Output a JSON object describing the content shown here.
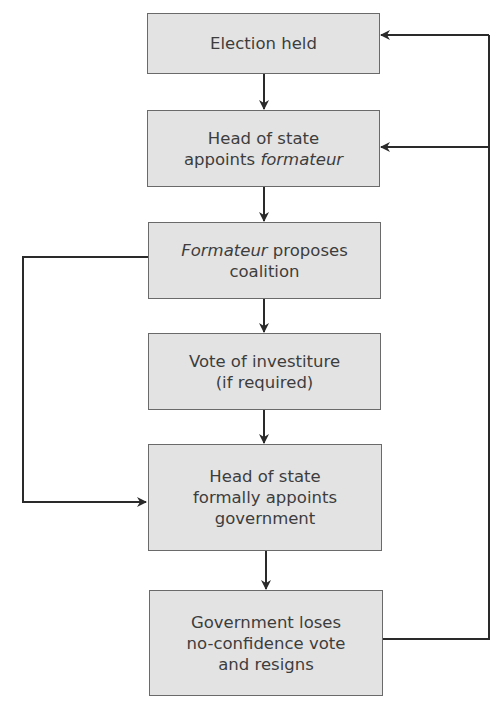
{
  "diagram": {
    "title": "",
    "nodes": [
      {
        "id": "election",
        "lines": [
          [
            {
              "t": "Election held",
              "i": false
            }
          ]
        ]
      },
      {
        "id": "appoint_formateur",
        "lines": [
          [
            {
              "t": "Head of state",
              "i": false
            }
          ],
          [
            {
              "t": "appoints ",
              "i": false
            },
            {
              "t": "formateur",
              "i": true
            }
          ]
        ]
      },
      {
        "id": "propose_coalition",
        "lines": [
          [
            {
              "t": "Formateur",
              "i": true
            },
            {
              "t": " proposes",
              "i": false
            }
          ],
          [
            {
              "t": "coalition",
              "i": false
            }
          ]
        ]
      },
      {
        "id": "investiture",
        "lines": [
          [
            {
              "t": "Vote of investiture",
              "i": false
            }
          ],
          [
            {
              "t": "(if required)",
              "i": false
            }
          ]
        ]
      },
      {
        "id": "appoint_government",
        "lines": [
          [
            {
              "t": "Head of state",
              "i": false
            }
          ],
          [
            {
              "t": "formally appoints",
              "i": false
            }
          ],
          [
            {
              "t": "government",
              "i": false
            }
          ]
        ]
      },
      {
        "id": "no_confidence",
        "lines": [
          [
            {
              "t": "Government loses",
              "i": false
            }
          ],
          [
            {
              "t": "no-confidence vote",
              "i": false
            }
          ],
          [
            {
              "t": "and resigns",
              "i": false
            }
          ]
        ]
      }
    ],
    "edges": [
      {
        "from": "election",
        "to": "appoint_formateur"
      },
      {
        "from": "appoint_formateur",
        "to": "propose_coalition"
      },
      {
        "from": "propose_coalition",
        "to": "investiture"
      },
      {
        "from": "investiture",
        "to": "appoint_government"
      },
      {
        "from": "appoint_government",
        "to": "no_confidence"
      },
      {
        "from": "propose_coalition",
        "to": "appoint_government",
        "route": "left-bypass"
      },
      {
        "from": "no_confidence",
        "to": "election",
        "route": "right-loop"
      },
      {
        "from": "no_confidence",
        "to": "appoint_formateur",
        "route": "right-loop"
      }
    ],
    "colors": {
      "box_fill": "#e3e3e3",
      "box_border": "#6a6a6a",
      "text": "#3d3d3d",
      "wire": "#2a2a2a"
    }
  }
}
